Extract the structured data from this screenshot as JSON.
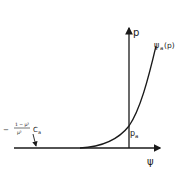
{
  "diagram": {
    "type": "plot-sketch",
    "axes": {
      "vertical_label": "p",
      "horizontal_label": "ψ"
    },
    "curve": {
      "label_main": "ψ",
      "label_sub": "a",
      "label_arg": "(p)"
    },
    "intercept": {
      "label_main": "p",
      "label_sub": "a"
    },
    "asymptote_label": {
      "sign": "−",
      "numerator": "1 − μ²",
      "denominator": "μ²",
      "symbol_main": "C",
      "symbol_sub": "a"
    },
    "colors": {
      "ink": "#1a1a1a",
      "background": "#ffffff"
    }
  }
}
